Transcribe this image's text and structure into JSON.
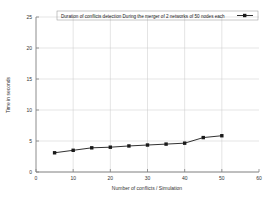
{
  "chart_data": {
    "type": "line",
    "title": "",
    "legend": [
      "Duration of conflicts detection During the merger of 2 networks of 50 nodes each"
    ],
    "legend_position": "top-inside",
    "xlabel": "Number of conflicts / Simulation",
    "ylabel": "Time in seconds",
    "xlim": [
      0,
      60
    ],
    "ylim": [
      0,
      25
    ],
    "xticks": [
      "0",
      "10",
      "20",
      "30",
      "40",
      "50",
      "60"
    ],
    "xtick_values": [
      0,
      10,
      20,
      30,
      40,
      50,
      60
    ],
    "yticks": [
      "0",
      "5",
      "10",
      "15",
      "20",
      "25"
    ],
    "ytick_values": [
      0,
      5,
      10,
      15,
      20,
      25
    ],
    "grid": true,
    "series": [
      {
        "name": "Duration of conflicts detection During the merger of 2 networks of 50 nodes each",
        "color": "#1a1a1a",
        "marker": "square",
        "x": [
          5,
          10,
          15,
          20,
          25,
          30,
          35,
          40,
          45,
          50
        ],
        "values": [
          3.1,
          3.5,
          3.9,
          4.0,
          4.2,
          4.35,
          4.5,
          4.65,
          5.55,
          5.85
        ]
      }
    ]
  },
  "axis_titles": {
    "x": "Number of conflicts / Simulation",
    "y": "Time in seconds"
  },
  "colors": {
    "series": "#1a1a1a",
    "grid": "#c8c8c8",
    "axis": "#808080",
    "background": "#ffffff"
  }
}
